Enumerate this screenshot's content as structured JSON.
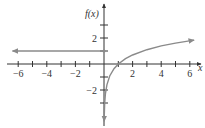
{
  "chart_data": {
    "type": "line",
    "title": "",
    "xlabel": "x",
    "ylabel": "f(x)",
    "xlim": [
      -6.5,
      6.6
    ],
    "ylim": [
      -4.5,
      4
    ],
    "grid": false,
    "legend": null,
    "x_ticks": [
      -6,
      -5,
      -4,
      -3,
      -2,
      -1,
      1,
      2,
      3,
      4,
      5,
      6
    ],
    "x_tick_labels": [
      "-6",
      "-4",
      "-2",
      "2",
      "4",
      "6"
    ],
    "x_tick_label_values": [
      -6,
      -4,
      -2,
      2,
      4,
      6
    ],
    "y_ticks": [
      -3,
      -2,
      -1,
      1,
      2,
      3
    ],
    "y_tick_labels": [
      "2",
      "-2"
    ],
    "y_tick_label_values": [
      2,
      -2
    ],
    "series": [
      {
        "name": "f(x) = 1, x ≤ 0",
        "kind": "constant",
        "x": [
          -6.4,
          0
        ],
        "y": [
          1,
          1
        ],
        "arrow_left": true,
        "closed_point_at": [
          0,
          1
        ],
        "color": "#8a8a8a"
      },
      {
        "name": "f(x) = ln(x), x > 0",
        "kind": "logarithmic",
        "x": [
          0.012,
          0.02,
          0.05,
          0.1,
          0.2,
          0.4,
          0.7,
          1,
          1.5,
          2,
          3,
          4,
          5,
          6.3
        ],
        "y": [
          -4.4,
          -3.91,
          -3.0,
          -2.3,
          -1.61,
          -0.92,
          -0.36,
          0,
          0.41,
          0.69,
          1.1,
          1.39,
          1.61,
          1.84
        ],
        "arrow_ends": true,
        "color": "#8a8a8a"
      }
    ],
    "colors": {
      "axis": "#333333",
      "curve": "#8a8a8a",
      "text": "#333333"
    }
  }
}
